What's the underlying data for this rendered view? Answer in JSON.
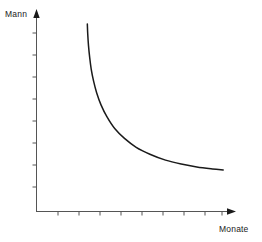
{
  "chart_data": {
    "type": "line",
    "title": "",
    "subtitle": "",
    "xlabel": "Monate",
    "ylabel": "Mann",
    "grid": false,
    "legend": null,
    "annotations": [],
    "axis_style": {
      "arrow_heads": true,
      "tick_labels": false,
      "axis_color": "#555555",
      "curve_color": "#1a1a1a"
    },
    "xlim": [
      0,
      10
    ],
    "ylim": [
      0,
      10
    ],
    "x_ticks": [
      1,
      2,
      3,
      4,
      5,
      6,
      7,
      8,
      9
    ],
    "y_ticks": [
      1,
      2,
      3,
      4,
      5,
      6,
      7,
      8,
      9
    ],
    "x_tick_labels": [],
    "y_tick_labels": [],
    "series": [
      {
        "name": "Mann-Monate",
        "relation": "hyperbolic",
        "x": [
          2.6,
          2.62,
          2.66,
          2.72,
          2.8,
          2.92,
          3.08,
          3.3,
          3.6,
          4.0,
          4.5,
          5.1,
          5.8,
          6.6,
          7.4,
          8.2,
          9.0,
          9.55
        ],
        "y": [
          9.5,
          9.0,
          8.4,
          7.8,
          7.2,
          6.6,
          6.0,
          5.4,
          4.8,
          4.2,
          3.7,
          3.25,
          2.9,
          2.6,
          2.4,
          2.25,
          2.15,
          2.1
        ]
      }
    ]
  },
  "labels": {
    "y_axis_caption": "Mann",
    "x_axis_caption": "Monate"
  },
  "colors": {
    "curve": "#1a1a1a",
    "axis": "#555555",
    "background": "#ffffff",
    "text": "#1a1a1a"
  }
}
